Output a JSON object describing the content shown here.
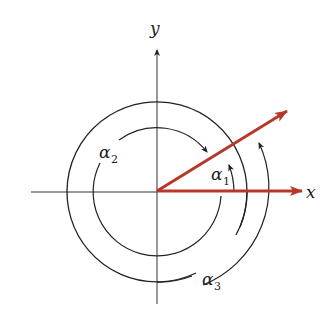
{
  "diagram": {
    "type": "angle-rotation-diagram",
    "axes": {
      "x_label": "x",
      "y_label": "y"
    },
    "angles": [
      {
        "id": "alpha1",
        "symbol": "α",
        "subscript": "1",
        "direction": "counterclockwise",
        "description": "from x-axis to red vector"
      },
      {
        "id": "alpha2",
        "symbol": "α",
        "subscript": "2",
        "direction": "clockwise",
        "description": "from red vector clockwise around to x-axis"
      },
      {
        "id": "alpha3",
        "symbol": "α",
        "subscript": "3",
        "direction": "counterclockwise",
        "description": "full turn plus alpha1"
      }
    ],
    "vector_angle_deg": 30,
    "colors": {
      "vector": "#b5392b",
      "lines": "#222222",
      "background": "#ffffff"
    }
  }
}
